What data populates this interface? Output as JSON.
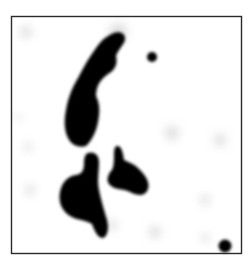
{
  "image": {
    "description": "Grayscale blot image with dark irregular blobs inside a thin black square frame",
    "colors": {
      "background": "#ffffff",
      "frame": "#2a2a2a",
      "blob": "#000000",
      "haze": "#d8d8d8"
    },
    "frame": {
      "x": 11,
      "y": 16,
      "width": 230,
      "height": 237
    },
    "blobs": [
      {
        "name": "upper-elongated-blob"
      },
      {
        "name": "upper-small-dot"
      },
      {
        "name": "lower-left-blob"
      },
      {
        "name": "middle-blob"
      },
      {
        "name": "bottom-right-dot"
      }
    ]
  }
}
